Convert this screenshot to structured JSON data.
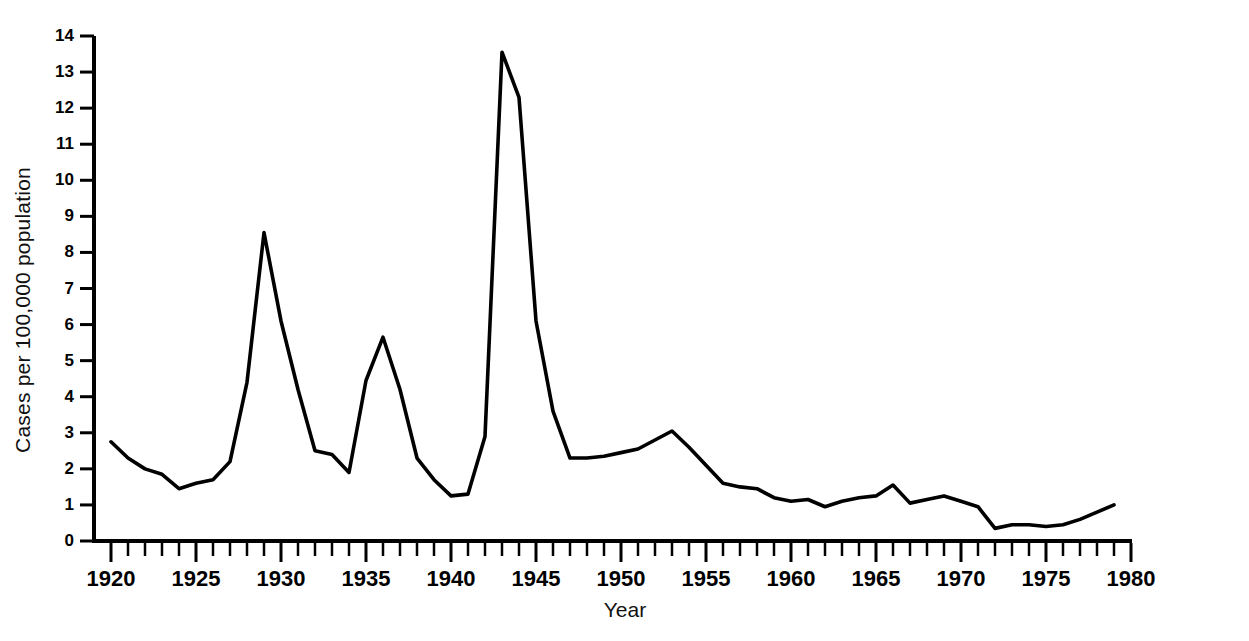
{
  "figure": {
    "background_color": "#ffffff",
    "line_color": "#000000"
  },
  "axis": {
    "y_title": "Cases per 100,000 population",
    "x_title": "Year",
    "y_tick_labels": [
      "14",
      "13",
      "12",
      "11",
      "10",
      "9",
      "8",
      "7",
      "6",
      "5",
      "4",
      "3",
      "2",
      "1",
      "0"
    ],
    "x_tick_labels": [
      "1920",
      "1925",
      "1930",
      "1935",
      "1940",
      "1945",
      "1950",
      "1955",
      "1960",
      "1965",
      "1970",
      "1975",
      "1980"
    ]
  },
  "chart_data": {
    "type": "line",
    "title": "",
    "xlabel": "Year",
    "ylabel": "Cases per 100,000 population",
    "xlim": [
      1920,
      1980
    ],
    "ylim": [
      0,
      14
    ],
    "xticks": [
      1920,
      1925,
      1930,
      1935,
      1940,
      1945,
      1950,
      1955,
      1960,
      1965,
      1970,
      1975,
      1980
    ],
    "yticks": [
      0,
      1,
      2,
      3,
      4,
      5,
      6,
      7,
      8,
      9,
      10,
      11,
      12,
      13,
      14
    ],
    "x_minor_tick_interval": 1,
    "grid": false,
    "legend": null,
    "series": [
      {
        "name": "Cases per 100,000 population",
        "x": [
          1920,
          1921,
          1922,
          1923,
          1924,
          1925,
          1926,
          1927,
          1928,
          1929,
          1930,
          1931,
          1932,
          1933,
          1934,
          1935,
          1936,
          1937,
          1938,
          1939,
          1940,
          1941,
          1942,
          1943,
          1944,
          1945,
          1946,
          1947,
          1948,
          1949,
          1950,
          1951,
          1952,
          1953,
          1954,
          1955,
          1956,
          1957,
          1958,
          1959,
          1960,
          1961,
          1962,
          1963,
          1964,
          1965,
          1966,
          1967,
          1968,
          1969,
          1970,
          1971,
          1972,
          1973,
          1974,
          1975,
          1976,
          1977,
          1978,
          1979
        ],
        "values": [
          2.75,
          2.3,
          2.0,
          1.85,
          1.45,
          1.6,
          1.7,
          2.2,
          4.4,
          8.55,
          6.1,
          4.2,
          2.5,
          2.4,
          1.9,
          4.45,
          5.65,
          4.2,
          2.3,
          1.7,
          1.25,
          1.3,
          2.9,
          13.55,
          12.3,
          6.1,
          3.6,
          2.3,
          2.3,
          2.35,
          2.45,
          2.55,
          2.8,
          3.05,
          2.6,
          2.1,
          1.6,
          1.5,
          1.45,
          1.2,
          1.1,
          1.15,
          0.95,
          1.1,
          1.2,
          1.25,
          1.55,
          1.05,
          1.15,
          1.25,
          1.1,
          0.95,
          0.35,
          0.45,
          0.45,
          0.4,
          0.45,
          0.6,
          0.8,
          1.0
        ]
      }
    ]
  }
}
